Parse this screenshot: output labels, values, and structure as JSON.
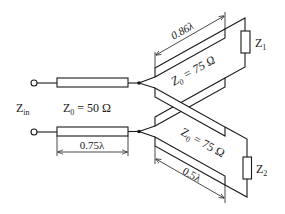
{
  "diagram": {
    "type": "transmission-line-circuit",
    "input_label": "Z",
    "input_label_sub": "in",
    "feed_line": {
      "impedance_label": "Z",
      "impedance_sub": "0",
      "impedance_value": " = 50 Ω",
      "length_label": "0.75λ"
    },
    "upper_branch": {
      "impedance_label": "Z",
      "impedance_sub": "0",
      "impedance_value": " = 75 Ω",
      "length_label": "0.86λ",
      "load_label": "Z",
      "load_sub": "1"
    },
    "lower_branch": {
      "impedance_label": "Z",
      "impedance_sub": "0",
      "impedance_value": " = 75 Ω",
      "length_label": "0.5λ",
      "load_label": "Z",
      "load_sub": "2"
    },
    "colors": {
      "line": "#1a1a1a",
      "background": "#ffffff"
    }
  }
}
